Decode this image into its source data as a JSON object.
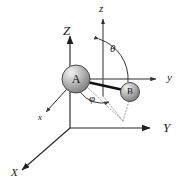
{
  "figure": {
    "type": "vector-diagram",
    "background_color": "#ffffff",
    "line_color": "#262626",
    "dotted_color": "#8c8c8c"
  },
  "space_frame": {
    "name": "space-fixed-axes",
    "origin": {
      "x": 70,
      "y": 128
    },
    "axes": [
      {
        "key": "X",
        "label": "X",
        "direction": "down-left",
        "tip": {
          "x": 14,
          "y": 176
        },
        "arrow": true
      },
      {
        "key": "Y",
        "label": "Y",
        "direction": "right",
        "tip": {
          "x": 159,
          "y": 128
        },
        "arrow": true
      },
      {
        "key": "Z",
        "label": "Z",
        "direction": "up",
        "tip": {
          "x": 70,
          "y": 30
        },
        "arrow": true
      }
    ],
    "labels": {
      "X": "X",
      "Y": "Y",
      "Z": "Z"
    }
  },
  "body_frame": {
    "name": "molecule-fixed-axes",
    "origin": {
      "x": 76,
      "y": 79
    },
    "axes": [
      {
        "key": "x",
        "label": "x",
        "direction": "down-left",
        "tip": {
          "x": 46,
          "y": 115
        },
        "arrow": true
      },
      {
        "key": "y",
        "label": "y",
        "direction": "right",
        "tip": {
          "x": 165,
          "y": 79
        },
        "arrow": true
      },
      {
        "key": "z",
        "label": "z",
        "direction": "up",
        "tip": {
          "x": 103,
          "y": 12
        },
        "arrow": true
      }
    ],
    "labels": {
      "x": "x",
      "y": "y",
      "z": "z"
    }
  },
  "atoms": [
    {
      "id": "A",
      "label": "A",
      "cx": 76,
      "cy": 79,
      "r": 14,
      "fill_light": "#e6e6e6",
      "fill_dark": "#8a8a8a",
      "stroke": "#4d4d4d"
    },
    {
      "id": "B",
      "label": "B",
      "cx": 130,
      "cy": 92,
      "r": 9.5,
      "fill_light": "#e0e0e0",
      "fill_dark": "#848484",
      "stroke": "#4d4d4d"
    }
  ],
  "bond": {
    "name": "bond-A-B",
    "from": "A",
    "to": "B",
    "width": 2.6,
    "color": "#111111"
  },
  "angles": [
    {
      "key": "theta",
      "label": "θ",
      "symbol_x": 112,
      "symbol_y": 48,
      "between": [
        "z-axis",
        "bond-A-B"
      ]
    },
    {
      "key": "phi",
      "label": "φ",
      "symbol_x": 92,
      "symbol_y": 98,
      "between": [
        "x-axis",
        "bond-projection"
      ]
    }
  ],
  "projections": {
    "name": "projection-lines",
    "style": "dotted",
    "lines": [
      {
        "from": {
          "x": 130,
          "y": 92
        },
        "to": {
          "x": 122,
          "y": 118
        }
      },
      {
        "from": {
          "x": 76,
          "y": 79
        },
        "to": {
          "x": 122,
          "y": 118
        }
      },
      {
        "from": {
          "x": 103,
          "y": 100
        },
        "to": {
          "x": 122,
          "y": 118
        }
      }
    ]
  }
}
